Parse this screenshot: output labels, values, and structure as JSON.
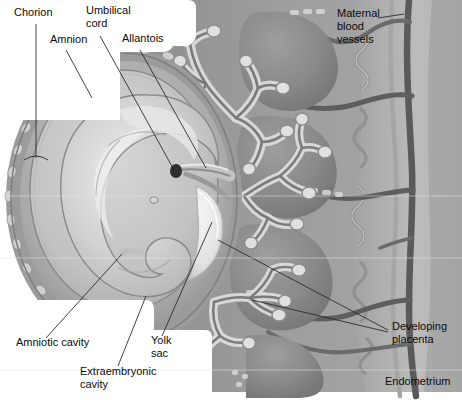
{
  "figure": {
    "type": "anatomical-diagram",
    "width": 462,
    "height": 400,
    "palette": {
      "page_background": "#ffffff",
      "uterine_tissue": "#9a9a9a",
      "endometrium_light": "#bdbdbd",
      "intervillous_space": "#8f8f8f",
      "chorion_ring": "#8c8c8c",
      "amnion_fluid": "#c9c9c9",
      "embryo_body": "#cfcfcf",
      "embryo_highlight": "#e8e8e8",
      "yolk_sac": "#ededed",
      "vessel_dark": "#5a5a5a",
      "vessel_mid": "#6f6f6f",
      "villi_light": "#d8d8d8",
      "leader_line": "#2b2b2b",
      "label_text": "#0b0b0b"
    }
  },
  "labels": [
    {
      "id": "chorion",
      "text": "Chorion",
      "lines": [
        "Chorion"
      ],
      "x": 14,
      "y": 16,
      "anchor": "start"
    },
    {
      "id": "umbilical-cord",
      "text": "Umbilical cord",
      "lines": [
        "Umbilical",
        "cord"
      ],
      "x": 86,
      "y": 14,
      "anchor": "start"
    },
    {
      "id": "amnion",
      "text": "Amnion",
      "lines": [
        "Amnion"
      ],
      "x": 50,
      "y": 43,
      "anchor": "start"
    },
    {
      "id": "allantois",
      "text": "Allantois",
      "lines": [
        "Allantois"
      ],
      "x": 122,
      "y": 42,
      "anchor": "start"
    },
    {
      "id": "maternal-blood-vessels",
      "text": "Maternal blood vessels",
      "lines": [
        "Maternal",
        "blood",
        "vessels"
      ],
      "x": 337,
      "y": 17,
      "anchor": "start"
    },
    {
      "id": "amniotic-cavity",
      "text": "Amniotic cavity",
      "lines": [
        "Amniotic cavity"
      ],
      "x": 16,
      "y": 346,
      "anchor": "start"
    },
    {
      "id": "yolk-sac",
      "text": "Yolk sac",
      "lines": [
        "Yolk",
        "sac"
      ],
      "x": 151,
      "y": 344,
      "anchor": "start"
    },
    {
      "id": "extraembryonic-cavity",
      "text": "Extraembryonic cavity",
      "lines": [
        "Extraembryonic",
        "cavity"
      ],
      "x": 80,
      "y": 375,
      "anchor": "start"
    },
    {
      "id": "developing-placenta",
      "text": "Developing placenta",
      "lines": [
        "Developing",
        "placenta"
      ],
      "x": 392,
      "y": 330,
      "anchor": "start"
    },
    {
      "id": "endometrium",
      "text": "Endometrium",
      "lines": [
        "Endometrium"
      ],
      "x": 385,
      "y": 385,
      "anchor": "start"
    }
  ],
  "structures": [
    {
      "id": "chorion",
      "name": "Chorion",
      "description": "Outer villous membrane surrounding the conceptus"
    },
    {
      "id": "amnion",
      "name": "Amnion",
      "description": "Inner membrane enclosing the amniotic cavity"
    },
    {
      "id": "umbilical-cord",
      "name": "Umbilical cord",
      "description": "Vascular stalk linking embryo to placenta"
    },
    {
      "id": "allantois",
      "name": "Allantois",
      "description": "Extraembryonic sac within the connecting stalk"
    },
    {
      "id": "embryo",
      "name": "Embryo",
      "description": "Curled embryo within amniotic cavity"
    },
    {
      "id": "yolk-sac",
      "name": "Yolk sac",
      "description": "Pale sac ventral to the embryo"
    },
    {
      "id": "amniotic-cavity",
      "name": "Amniotic cavity",
      "description": "Fluid space inside the amnion"
    },
    {
      "id": "extraembryonic-cavity",
      "name": "Extraembryonic cavity",
      "description": "Chorionic cavity between amnion and chorion"
    },
    {
      "id": "developing-placenta",
      "name": "Developing placenta",
      "description": "Chorionic villi tree invading the endometrium"
    },
    {
      "id": "maternal-blood-vessels",
      "name": "Maternal blood vessels",
      "description": "Spiral arteries and veins in the uterine wall"
    },
    {
      "id": "endometrium",
      "name": "Endometrium",
      "description": "Uterine lining with glands"
    }
  ]
}
